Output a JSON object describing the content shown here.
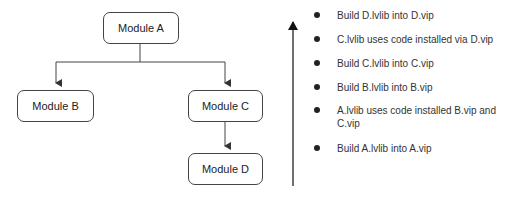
{
  "diagram": {
    "modules": [
      {
        "id": "A",
        "label": "Module A"
      },
      {
        "id": "B",
        "label": "Module B"
      },
      {
        "id": "C",
        "label": "Module C"
      },
      {
        "id": "D",
        "label": "Module D"
      }
    ],
    "edges": [
      {
        "from": "A",
        "to": "B"
      },
      {
        "from": "A",
        "to": "C"
      },
      {
        "from": "C",
        "to": "D"
      }
    ],
    "line_color": "#444444"
  },
  "build_order": {
    "direction": "bottom-to-top",
    "steps": [
      "Build D.lvlib into D.vip",
      "C.lvlib uses code installed via D.vip",
      "Build C.lvlib into C.vip",
      "Build B.lvlib into B.vip",
      "A.lvlib uses code installed B.vip and C.vip",
      "Build A.lvlib into A.vip"
    ]
  }
}
